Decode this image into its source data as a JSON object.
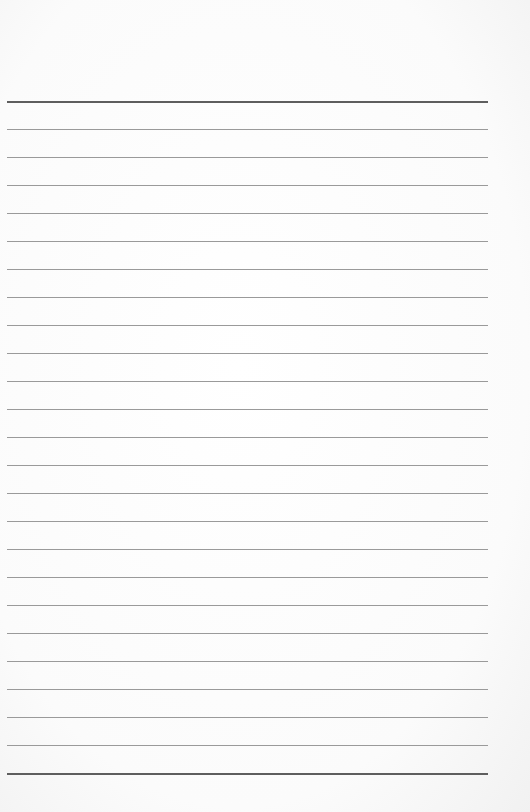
{
  "page": {
    "type": "lined-paper",
    "background_color": "#fbfbfb",
    "rule_color": "#9a9a9a",
    "rule_strong_color": "#5e5e5e",
    "first_rule_y": 101,
    "rule_spacing": 28,
    "rule_count": 25,
    "rule_left": 7,
    "rule_width": 481
  }
}
